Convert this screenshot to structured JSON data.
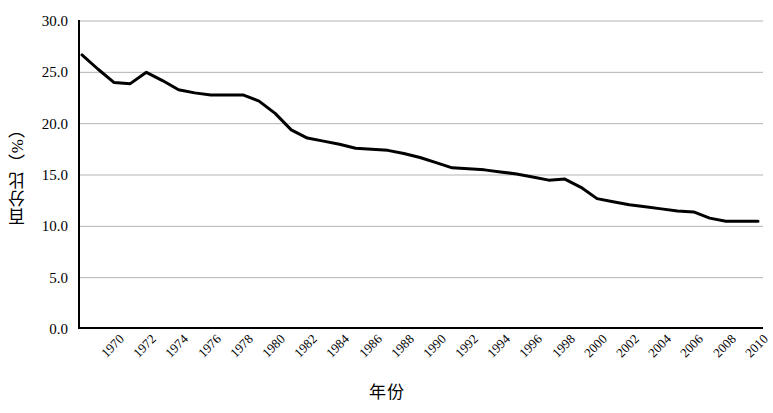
{
  "chart_data": {
    "type": "line",
    "title": "",
    "xlabel": "年份",
    "ylabel": "百分比（%）",
    "xlim": [
      1970,
      2012
    ],
    "ylim": [
      0.0,
      30.0
    ],
    "grid": true,
    "legend": "none",
    "y_ticks": [
      "0.0",
      "5.0",
      "10.0",
      "15.0",
      "20.0",
      "25.0",
      "30.0"
    ],
    "y_tick_values": [
      0.0,
      5.0,
      10.0,
      15.0,
      20.0,
      25.0,
      30.0
    ],
    "x_ticks": [
      "1970",
      "1972",
      "1974",
      "1976",
      "1978",
      "1980",
      "1982",
      "1984",
      "1986",
      "1988",
      "1990",
      "1992",
      "1994",
      "1996",
      "1998",
      "2000",
      "2002",
      "2004",
      "2006",
      "2008",
      "2010",
      "2012"
    ],
    "x_tick_values": [
      1970,
      1972,
      1974,
      1976,
      1978,
      1980,
      1982,
      1984,
      1986,
      1988,
      1990,
      1992,
      1994,
      1996,
      1998,
      2000,
      2002,
      2004,
      2006,
      2008,
      2010,
      2012
    ],
    "x": [
      1970,
      1971,
      1972,
      1973,
      1974,
      1975,
      1976,
      1977,
      1978,
      1979,
      1980,
      1981,
      1982,
      1983,
      1984,
      1985,
      1986,
      1987,
      1988,
      1989,
      1990,
      1991,
      1992,
      1993,
      1994,
      1995,
      1996,
      1997,
      1998,
      1999,
      2000,
      2001,
      2002,
      2003,
      2004,
      2005,
      2006,
      2007,
      2008,
      2009,
      2010,
      2011,
      2012
    ],
    "values": [
      26.7,
      25.3,
      24.0,
      23.9,
      25.0,
      24.2,
      23.3,
      23.0,
      22.8,
      22.8,
      22.8,
      22.2,
      21.0,
      19.4,
      18.6,
      18.3,
      18.0,
      17.6,
      17.5,
      17.4,
      17.1,
      16.7,
      16.2,
      15.7,
      15.6,
      15.5,
      15.3,
      15.1,
      14.8,
      14.5,
      14.6,
      13.8,
      12.7,
      12.4,
      12.1,
      11.9,
      11.7,
      11.5,
      11.4,
      10.8,
      10.5,
      10.5,
      10.5
    ],
    "series": [
      {
        "name": "百分比",
        "color": "#000000",
        "line_width": 3,
        "values": [
          26.7,
          25.3,
          24.0,
          23.9,
          25.0,
          24.2,
          23.3,
          23.0,
          22.8,
          22.8,
          22.8,
          22.2,
          21.0,
          19.4,
          18.6,
          18.3,
          18.0,
          17.6,
          17.5,
          17.4,
          17.1,
          16.7,
          16.2,
          15.7,
          15.6,
          15.5,
          15.3,
          15.1,
          14.8,
          14.5,
          14.6,
          13.8,
          12.7,
          12.4,
          12.1,
          11.9,
          11.7,
          11.5,
          11.4,
          10.8,
          10.5,
          10.5,
          10.5
        ]
      }
    ],
    "colors": {
      "line": "#000000",
      "grid": "#b4b4b4",
      "axis": "#000000",
      "background": "#ffffff"
    }
  }
}
